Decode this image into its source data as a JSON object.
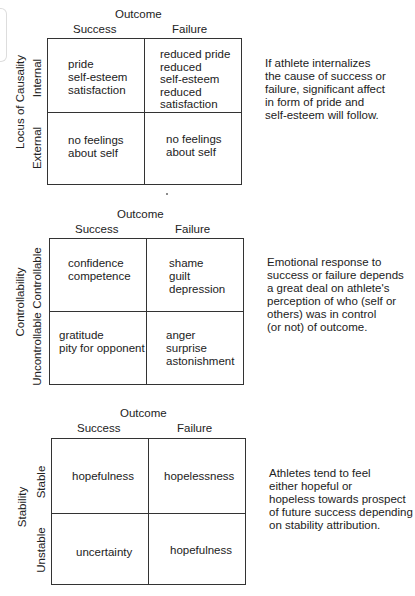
{
  "panels": [
    {
      "outcome": "Outcome",
      "col_success": "Success",
      "col_failure": "Failure",
      "axis": "Locus of Causality",
      "row1": "Internal",
      "row2": "External",
      "cells": {
        "r1_success": "pride\nself-esteem\nsatisfaction",
        "r1_failure": "reduced pride\nreduced\nself-esteem\nreduced\nsatisfaction",
        "r2_success": "no feelings\nabout self",
        "r2_failure": "no feelings\nabout self"
      },
      "note": "If athlete internalizes\nthe cause of success or\nfailure, significant affect\nin form of pride and\nself-esteem will follow."
    },
    {
      "outcome": "Outcome",
      "col_success": "Success",
      "col_failure": "Failure",
      "axis": "Controllability",
      "row1": "Controllable",
      "row2": "Uncontrollable",
      "cells": {
        "r1_success": "confidence\ncompetence",
        "r1_failure": "shame\nguilt\ndepression",
        "r2_success": "gratitude\npity for opponent",
        "r2_failure": "anger\nsurprise\nastonishment"
      },
      "note": "Emotional response to\nsuccess or failure depends\na great deal on athlete's\nperception of who (self or\nothers) was in control\n(or not) of outcome."
    },
    {
      "outcome": "Outcome",
      "col_success": "Success",
      "col_failure": "Failure",
      "axis": "Stability",
      "row1": "Stable",
      "row2": "Unstable",
      "cells": {
        "r1_success": "hopefulness",
        "r1_failure": "hopelessness",
        "r2_success": "uncertainty",
        "r2_failure": "hopefulness"
      },
      "note": "Athletes tend to feel\neither hopeful or\nhopeless towards prospect\nof future success depending\non stability attribution."
    }
  ]
}
